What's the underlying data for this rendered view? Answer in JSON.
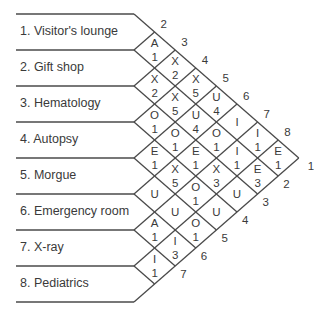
{
  "departments": [
    {
      "id": 1,
      "label": "1.  Visitor's lounge"
    },
    {
      "id": 2,
      "label": "2.  Gift shop"
    },
    {
      "id": 3,
      "label": "3.  Hematology"
    },
    {
      "id": 4,
      "label": "4.  Autopsy"
    },
    {
      "id": 5,
      "label": "5.  Morgue"
    },
    {
      "id": 6,
      "label": "6.  Emergency room"
    },
    {
      "id": 7,
      "label": "7.  X-ray"
    },
    {
      "id": 8,
      "label": "8.  Pediatrics"
    }
  ],
  "relationships": [
    {
      "i": 1,
      "j": 2,
      "code": "A",
      "reason": "1"
    },
    {
      "i": 1,
      "j": 3,
      "code": "X",
      "reason": "2"
    },
    {
      "i": 1,
      "j": 4,
      "code": "X",
      "reason": "5"
    },
    {
      "i": 1,
      "j": 5,
      "code": "U",
      "reason": "4"
    },
    {
      "i": 1,
      "j": 6,
      "code": "I",
      "reason": ""
    },
    {
      "i": 1,
      "j": 7,
      "code": "I",
      "reason": "1"
    },
    {
      "i": 1,
      "j": 8,
      "code": "E",
      "reason": "1"
    },
    {
      "i": 2,
      "j": 3,
      "code": "X",
      "reason": "2"
    },
    {
      "i": 2,
      "j": 4,
      "code": "X",
      "reason": "5"
    },
    {
      "i": 2,
      "j": 5,
      "code": "U",
      "reason": "4"
    },
    {
      "i": 2,
      "j": 6,
      "code": "O",
      "reason": "1"
    },
    {
      "i": 2,
      "j": 7,
      "code": "I",
      "reason": "1"
    },
    {
      "i": 2,
      "j": 8,
      "code": "E",
      "reason": "3"
    },
    {
      "i": 3,
      "j": 4,
      "code": "O",
      "reason": "1"
    },
    {
      "i": 3,
      "j": 5,
      "code": "O",
      "reason": "1"
    },
    {
      "i": 3,
      "j": 6,
      "code": "E",
      "reason": "1"
    },
    {
      "i": 3,
      "j": 7,
      "code": "X",
      "reason": "3"
    },
    {
      "i": 3,
      "j": 8,
      "code": "U",
      "reason": ""
    },
    {
      "i": 4,
      "j": 5,
      "code": "E",
      "reason": "1"
    },
    {
      "i": 4,
      "j": 6,
      "code": "X",
      "reason": "5"
    },
    {
      "i": 4,
      "j": 7,
      "code": "O",
      "reason": "1"
    },
    {
      "i": 4,
      "j": 8,
      "code": "U",
      "reason": ""
    },
    {
      "i": 5,
      "j": 6,
      "code": "U",
      "reason": ""
    },
    {
      "i": 5,
      "j": 7,
      "code": "U",
      "reason": ""
    },
    {
      "i": 5,
      "j": 8,
      "code": "O",
      "reason": "1"
    },
    {
      "i": 6,
      "j": 7,
      "code": "A",
      "reason": "1"
    },
    {
      "i": 6,
      "j": 8,
      "code": "I",
      "reason": "3"
    },
    {
      "i": 7,
      "j": 8,
      "code": "I",
      "reason": "1"
    }
  ],
  "top_edge_numbers": [
    "2",
    "3",
    "4",
    "5",
    "6",
    "7",
    "8"
  ],
  "bottom_edge_numbers": [
    "1",
    "2",
    "3",
    "4",
    "5",
    "6",
    "7"
  ],
  "colors": {
    "line": "#4a4a4a",
    "text": "#3a3a3a"
  }
}
